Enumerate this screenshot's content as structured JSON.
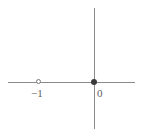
{
  "figure": {
    "kind": "number-line-graph",
    "width": 141,
    "height": 137,
    "background_color": "#ffffff"
  },
  "chart_data": {
    "type": "scatter",
    "title": "",
    "subtitle": "",
    "xlabel": "",
    "ylabel": "",
    "grid": false,
    "legend": null,
    "axes": {
      "x_axis": {
        "visible": true,
        "color": "#8a8a8a",
        "origin_x": -0.0,
        "tick_labels": [
          "-1",
          "0"
        ],
        "tick_values": [
          -1,
          0
        ]
      },
      "y_axis": {
        "visible": true,
        "color": "#8a8a8a",
        "tick_labels": [],
        "tick_values": []
      }
    },
    "points": [
      {
        "label": "-1",
        "x": -1,
        "y": 0,
        "marker": "open-circle",
        "filled": false,
        "color": "#7c7c7c"
      },
      {
        "label": "0",
        "x": 0,
        "y": 0,
        "marker": "filled-circle",
        "filled": true,
        "color": "#3a3a3a"
      }
    ],
    "annotations": [
      {
        "text": "-1",
        "x": -1,
        "y": 0,
        "position": "below-left"
      },
      {
        "text": "0",
        "x": 0,
        "y": 0,
        "position": "below-right"
      }
    ]
  },
  "labels": {
    "neg_one": "−1",
    "zero": "0"
  },
  "colors": {
    "axis": "#8a8a8a",
    "open_point": "#7c7c7c",
    "closed_point": "#3a3a3a",
    "text": "#5e5e5e",
    "background": "#ffffff"
  }
}
